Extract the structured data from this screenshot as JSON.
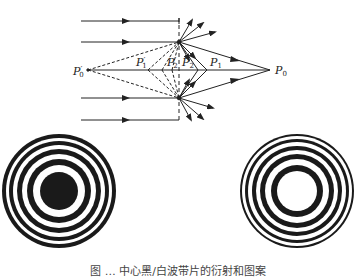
{
  "figure": {
    "diagram": {
      "labels": {
        "P0_prime": "P",
        "P0_prime_sub": "0",
        "P1_prime": "P",
        "P1_prime_sub": "1",
        "P2_prime": "P",
        "P2_prime_sub": "2",
        "P2": "P",
        "P2_sub": "2",
        "P1": "P",
        "P1_sub": "1",
        "P0": "P",
        "P0_sub": "0",
        "prime_mark": "′"
      },
      "line_color": "#222222"
    },
    "zone_plates": [
      {
        "name": "left-zone-plate",
        "center": "black"
      },
      {
        "name": "right-zone-plate",
        "center": "white"
      }
    ],
    "caption": "图 … 中心黑/白波带片的衍射和图案"
  }
}
